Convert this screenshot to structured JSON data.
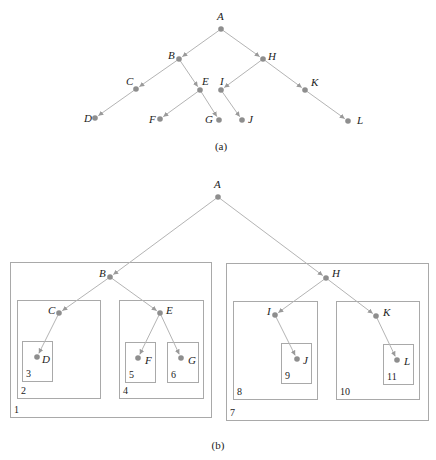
{
  "colors": {
    "edge": "#b4b4b4",
    "node": "#8e8e8e",
    "box": "#a9a9a9",
    "text": "#222222"
  },
  "diagram_a": {
    "caption": "(a)",
    "caption_pos": [
      221,
      150
    ],
    "nodes": [
      {
        "id": "A",
        "x": 221,
        "y": 29,
        "lx": 217,
        "ly": 20
      },
      {
        "id": "B",
        "x": 179,
        "y": 59,
        "lx": 168,
        "ly": 59
      },
      {
        "id": "C",
        "x": 136,
        "y": 89,
        "lx": 126,
        "ly": 85
      },
      {
        "id": "D",
        "x": 95,
        "y": 118,
        "lx": 84,
        "ly": 122
      },
      {
        "id": "E",
        "x": 200,
        "y": 90,
        "lx": 202,
        "ly": 85
      },
      {
        "id": "F",
        "x": 160,
        "y": 119,
        "lx": 149,
        "ly": 123
      },
      {
        "id": "G",
        "x": 219,
        "y": 120,
        "lx": 205,
        "ly": 123
      },
      {
        "id": "H",
        "x": 263,
        "y": 59,
        "lx": 268,
        "ly": 60
      },
      {
        "id": "I",
        "x": 221,
        "y": 90,
        "lx": 220,
        "ly": 85
      },
      {
        "id": "J",
        "x": 242,
        "y": 120,
        "lx": 248,
        "ly": 123
      },
      {
        "id": "K",
        "x": 305,
        "y": 90,
        "lx": 311,
        "ly": 86
      },
      {
        "id": "L",
        "x": 348,
        "y": 121,
        "lx": 357,
        "ly": 124
      }
    ],
    "edges": [
      [
        "A",
        "B"
      ],
      [
        "A",
        "H"
      ],
      [
        "B",
        "C"
      ],
      [
        "B",
        "E"
      ],
      [
        "C",
        "D"
      ],
      [
        "E",
        "F"
      ],
      [
        "E",
        "G"
      ],
      [
        "H",
        "I"
      ],
      [
        "H",
        "K"
      ],
      [
        "I",
        "J"
      ],
      [
        "K",
        "L"
      ]
    ]
  },
  "diagram_b": {
    "caption": "(b)",
    "caption_pos": [
      218,
      449
    ],
    "nodes": [
      {
        "id": "A",
        "x": 218,
        "y": 197,
        "lx": 214,
        "ly": 188
      },
      {
        "id": "B",
        "x": 110,
        "y": 277,
        "lx": 99,
        "ly": 277
      },
      {
        "id": "C",
        "x": 59,
        "y": 313,
        "lx": 48,
        "ly": 314
      },
      {
        "id": "D",
        "x": 37,
        "y": 357,
        "lx": 42,
        "ly": 363
      },
      {
        "id": "E",
        "x": 160,
        "y": 313,
        "lx": 166,
        "ly": 314
      },
      {
        "id": "F",
        "x": 138,
        "y": 358,
        "lx": 145,
        "ly": 364
      },
      {
        "id": "G",
        "x": 181,
        "y": 358,
        "lx": 188,
        "ly": 364
      },
      {
        "id": "H",
        "x": 326,
        "y": 278,
        "lx": 332,
        "ly": 277
      },
      {
        "id": "I",
        "x": 275,
        "y": 315,
        "lx": 267,
        "ly": 315
      },
      {
        "id": "J",
        "x": 297,
        "y": 359,
        "lx": 303,
        "ly": 364
      },
      {
        "id": "K",
        "x": 376,
        "y": 316,
        "lx": 383,
        "ly": 316
      },
      {
        "id": "L",
        "x": 397,
        "y": 360,
        "lx": 404,
        "ly": 365
      }
    ],
    "edges": [
      [
        "A",
        "B"
      ],
      [
        "A",
        "H"
      ],
      [
        "B",
        "C"
      ],
      [
        "B",
        "E"
      ],
      [
        "C",
        "D"
      ],
      [
        "E",
        "F"
      ],
      [
        "E",
        "G"
      ],
      [
        "H",
        "I"
      ],
      [
        "H",
        "K"
      ],
      [
        "I",
        "J"
      ],
      [
        "K",
        "L"
      ]
    ],
    "boxes": [
      {
        "label": "1",
        "x": 10,
        "y": 262,
        "w": 201,
        "h": 155
      },
      {
        "label": "2",
        "x": 17,
        "y": 300,
        "w": 83,
        "h": 98
      },
      {
        "label": "3",
        "x": 22,
        "y": 341,
        "w": 30,
        "h": 40
      },
      {
        "label": "4",
        "x": 119,
        "y": 300,
        "w": 84,
        "h": 98
      },
      {
        "label": "5",
        "x": 125,
        "y": 342,
        "w": 30,
        "h": 40
      },
      {
        "label": "6",
        "x": 167,
        "y": 342,
        "w": 31,
        "h": 40
      },
      {
        "label": "7",
        "x": 226,
        "y": 263,
        "w": 202,
        "h": 157
      },
      {
        "label": "8",
        "x": 233,
        "y": 301,
        "w": 84,
        "h": 98
      },
      {
        "label": "9",
        "x": 281,
        "y": 343,
        "w": 30,
        "h": 40
      },
      {
        "label": "10",
        "x": 336,
        "y": 301,
        "w": 83,
        "h": 98
      },
      {
        "label": "11",
        "x": 383,
        "y": 344,
        "w": 30,
        "h": 40
      }
    ]
  }
}
